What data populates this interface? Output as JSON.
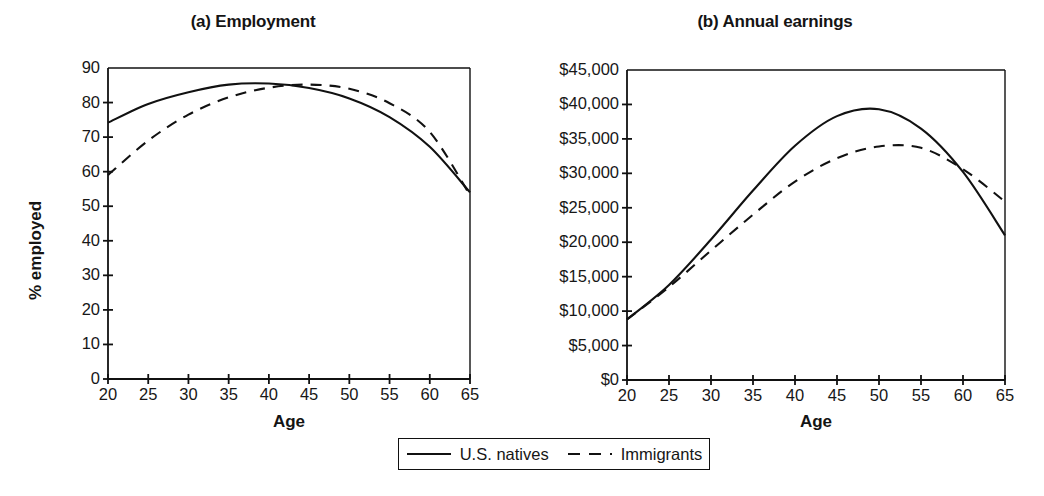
{
  "figure": {
    "panels": [
      {
        "id": "a",
        "title": "(a) Employment",
        "xlabel": "Age",
        "ylabel": "% employed"
      },
      {
        "id": "b",
        "title": "(b) Annual earnings",
        "xlabel": "Age",
        "ylabel": "Average annual earnings"
      }
    ]
  },
  "legend": {
    "entries": [
      {
        "label": "U.S. natives",
        "style": "solid",
        "icon": "solid-line-swatch"
      },
      {
        "label": "Immigrants",
        "style": "dashed",
        "icon": "dashed-line-swatch"
      }
    ]
  },
  "chart_data": [
    {
      "type": "line",
      "id": "a",
      "title": "(a) Employment",
      "xlabel": "Age",
      "ylabel": "% employed",
      "xlim": [
        20,
        65
      ],
      "ylim": [
        0,
        90
      ],
      "xticks": [
        20,
        25,
        30,
        35,
        40,
        45,
        50,
        55,
        60,
        65
      ],
      "yticks": [
        0,
        10,
        20,
        30,
        40,
        50,
        60,
        70,
        80,
        90
      ],
      "xticklabels": [
        "20",
        "25",
        "30",
        "35",
        "40",
        "45",
        "50",
        "55",
        "60",
        "65"
      ],
      "yticklabels": [
        "0",
        "10",
        "20",
        "30",
        "40",
        "50",
        "60",
        "70",
        "80",
        "90"
      ],
      "grid": false,
      "legend_position": "below-figure",
      "x": [
        20,
        25,
        30,
        35,
        40,
        45,
        50,
        55,
        60,
        65
      ],
      "series": [
        {
          "name": "U.S. natives",
          "style": "solid",
          "values": [
            74.2,
            79.6,
            83.0,
            85.2,
            85.5,
            84.2,
            81.2,
            75.8,
            67.2,
            54.0
          ]
        },
        {
          "name": "Immigrants",
          "style": "dashed",
          "values": [
            59.0,
            69.0,
            76.5,
            81.5,
            84.3,
            85.2,
            84.0,
            79.8,
            71.5,
            53.2
          ]
        }
      ]
    },
    {
      "type": "line",
      "id": "b",
      "title": "(b) Annual earnings",
      "xlabel": "Age",
      "ylabel": "Average annual earnings",
      "xlim": [
        20,
        65
      ],
      "ylim": [
        0,
        45000
      ],
      "xticks": [
        20,
        25,
        30,
        35,
        40,
        45,
        50,
        55,
        60,
        65
      ],
      "yticks": [
        0,
        5000,
        10000,
        15000,
        20000,
        25000,
        30000,
        35000,
        40000,
        45000
      ],
      "xticklabels": [
        "20",
        "25",
        "30",
        "35",
        "40",
        "45",
        "50",
        "55",
        "60",
        "65"
      ],
      "yticklabels": [
        "$0",
        "$5,000",
        "$10,000",
        "$15,000",
        "$20,000",
        "$25,000",
        "$30,000",
        "$35,000",
        "$40,000",
        "$45,000"
      ],
      "grid": false,
      "legend_position": "below-figure",
      "x": [
        20,
        25,
        30,
        35,
        40,
        45,
        50,
        55,
        60,
        65
      ],
      "series": [
        {
          "name": "U.S. natives",
          "style": "solid",
          "values": [
            8800,
            13800,
            20400,
            27500,
            34000,
            38300,
            39300,
            36500,
            30200,
            21000
          ]
        },
        {
          "name": "Immigrants",
          "style": "dashed",
          "values": [
            8800,
            13500,
            18800,
            24000,
            28800,
            32200,
            33900,
            33700,
            30600,
            25900
          ]
        }
      ]
    }
  ]
}
